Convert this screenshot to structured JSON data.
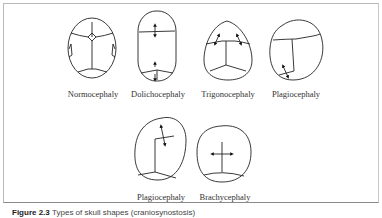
{
  "figure": {
    "row1": [
      {
        "label": "Normocephaly"
      },
      {
        "label": "Dolichocephaly"
      },
      {
        "label": "Trigonocephaly"
      },
      {
        "label": "Plagiocephaly"
      }
    ],
    "row2": [
      {
        "label": "Plagiocephaly"
      },
      {
        "label": "Brachycephaly"
      }
    ]
  },
  "caption": {
    "number": "Figure 2.3",
    "text": "Types of skull shapes (craniosynostosis)"
  },
  "colors": {
    "line": "#222222",
    "frame": "#b9b9b9",
    "background": "#ffffff"
  }
}
